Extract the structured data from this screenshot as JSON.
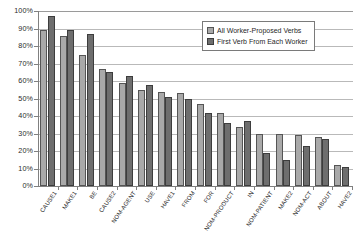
{
  "chart_data": {
    "type": "bar",
    "title": "",
    "xlabel": "",
    "ylabel": "",
    "ylim": [
      0,
      100
    ],
    "ytick_labels": [
      "100%",
      "90%",
      "80%",
      "70%",
      "60%",
      "50%",
      "40%",
      "30%",
      "20%",
      "10%",
      "0%"
    ],
    "ytick_values": [
      100,
      90,
      80,
      70,
      60,
      50,
      40,
      30,
      20,
      10,
      0
    ],
    "grid": true,
    "legend_position": "top-right",
    "categories": [
      "CAUSE1",
      "MAKE1",
      "BE",
      "CAUSE2",
      "NOM-AGENT",
      "USE",
      "HAVE1",
      "FROM",
      "FOR",
      "NOM-PRODUCT",
      "IN",
      "NOM-PATIENT",
      "MAKE2",
      "NOM-ACT",
      "ABOUT",
      "HAVE2"
    ],
    "series": [
      {
        "name": "All Worker-Proposed Verbs",
        "color": "#a9a9a9",
        "values": [
          89,
          86,
          75,
          67,
          59,
          55,
          54,
          53,
          47,
          42,
          34,
          30,
          30,
          29,
          28,
          12
        ]
      },
      {
        "name": "First Verb From Each Worker",
        "color": "#6e6e6e",
        "values": [
          97,
          89,
          87,
          65,
          63,
          58,
          51,
          50,
          42,
          36,
          37,
          19,
          15,
          23,
          27,
          11
        ]
      }
    ]
  }
}
